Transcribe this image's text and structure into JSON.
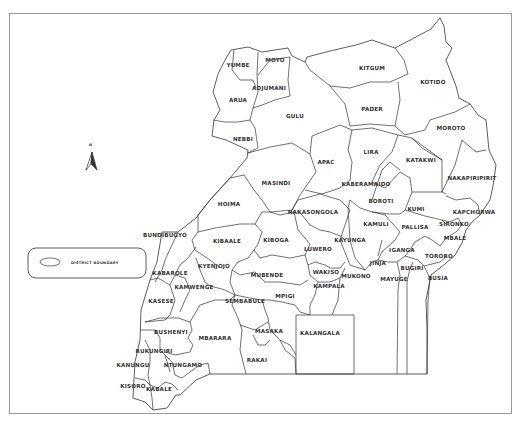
{
  "map": {
    "country": "Uganda",
    "north_label": "N",
    "legend": {
      "items": [
        {
          "symbol": "ellipse-outline",
          "label": "DISTRICT BOUNDARY"
        }
      ]
    },
    "districts": [
      {
        "name": "YUMBE",
        "x": 238,
        "y": 67
      },
      {
        "name": "MOYO",
        "x": 275,
        "y": 62
      },
      {
        "name": "ADJUMANI",
        "x": 269,
        "y": 90
      },
      {
        "name": "ARUA",
        "x": 238,
        "y": 102
      },
      {
        "name": "NEBBI",
        "x": 243,
        "y": 141
      },
      {
        "name": "GULU",
        "x": 295,
        "y": 118
      },
      {
        "name": "KITGUM",
        "x": 372,
        "y": 70
      },
      {
        "name": "PADER",
        "x": 372,
        "y": 111
      },
      {
        "name": "KOTIDO",
        "x": 433,
        "y": 84
      },
      {
        "name": "MOROTO",
        "x": 451,
        "y": 130
      },
      {
        "name": "APAC",
        "x": 326,
        "y": 164
      },
      {
        "name": "LIRA",
        "x": 371,
        "y": 154
      },
      {
        "name": "KATAKWI",
        "x": 421,
        "y": 162
      },
      {
        "name": "NAKAPIRIPIRIT",
        "x": 472,
        "y": 180
      },
      {
        "name": "KABERAMAIDO",
        "x": 366,
        "y": 186
      },
      {
        "name": "MASINDI",
        "x": 276,
        "y": 185
      },
      {
        "name": "HOIMA",
        "x": 229,
        "y": 206
      },
      {
        "name": "BOROTI",
        "x": 381,
        "y": 203
      },
      {
        "name": "KUMI",
        "x": 416,
        "y": 211
      },
      {
        "name": "KAPCHORWA",
        "x": 474,
        "y": 214
      },
      {
        "name": "NAKASONGOLA",
        "x": 313,
        "y": 214
      },
      {
        "name": "KAMULI",
        "x": 376,
        "y": 226
      },
      {
        "name": "PALLISA",
        "x": 415,
        "y": 229
      },
      {
        "name": "SIRONKO",
        "x": 454,
        "y": 226
      },
      {
        "name": "MBALE",
        "x": 455,
        "y": 240
      },
      {
        "name": "BUNDIBUGYO",
        "x": 165,
        "y": 237
      },
      {
        "name": "KIBAALE",
        "x": 227,
        "y": 243
      },
      {
        "name": "KIBOGA",
        "x": 276,
        "y": 242
      },
      {
        "name": "KAYUNGA",
        "x": 350,
        "y": 242
      },
      {
        "name": "LUWERO",
        "x": 318,
        "y": 251
      },
      {
        "name": "IGANGA",
        "x": 402,
        "y": 252
      },
      {
        "name": "TORORO",
        "x": 439,
        "y": 258
      },
      {
        "name": "JINJA",
        "x": 378,
        "y": 265
      },
      {
        "name": "KYENJOJO",
        "x": 214,
        "y": 268
      },
      {
        "name": "KABAROLE",
        "x": 170,
        "y": 275
      },
      {
        "name": "MUBENDE",
        "x": 267,
        "y": 277
      },
      {
        "name": "WAKISO",
        "x": 326,
        "y": 274
      },
      {
        "name": "MUKONO",
        "x": 356,
        "y": 278
      },
      {
        "name": "MAYUGE",
        "x": 394,
        "y": 281
      },
      {
        "name": "BUGIRI",
        "x": 412,
        "y": 270
      },
      {
        "name": "BUSIA",
        "x": 438,
        "y": 280
      },
      {
        "name": "KAMWENGE",
        "x": 194,
        "y": 289
      },
      {
        "name": "KAMPALA",
        "x": 329,
        "y": 288
      },
      {
        "name": "KASESE",
        "x": 161,
        "y": 303
      },
      {
        "name": "SEMBABULE",
        "x": 245,
        "y": 303
      },
      {
        "name": "MPIGI",
        "x": 285,
        "y": 298
      },
      {
        "name": "BUSHENYI",
        "x": 171,
        "y": 334
      },
      {
        "name": "MBARARA",
        "x": 215,
        "y": 340
      },
      {
        "name": "MASAKA",
        "x": 269,
        "y": 333
      },
      {
        "name": "KALANGALA",
        "x": 320,
        "y": 335
      },
      {
        "name": "RUKUNGIRI",
        "x": 154,
        "y": 353
      },
      {
        "name": "KANUNGU",
        "x": 133,
        "y": 367
      },
      {
        "name": "NTUNGAMO",
        "x": 183,
        "y": 367
      },
      {
        "name": "RAKAI",
        "x": 257,
        "y": 362
      },
      {
        "name": "KISORO",
        "x": 133,
        "y": 388
      },
      {
        "name": "KABALE",
        "x": 159,
        "y": 391
      }
    ]
  }
}
